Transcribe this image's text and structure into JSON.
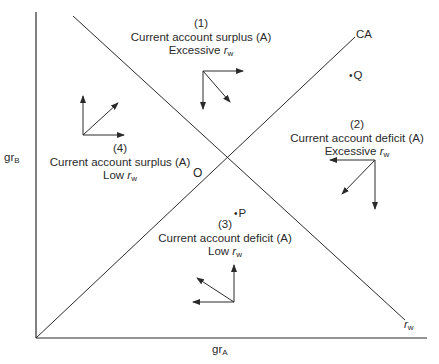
{
  "diagram": {
    "axes": {
      "x_label": "gr",
      "x_label_sub": "A",
      "y_label": "gr",
      "y_label_sub": "B"
    },
    "lines": {
      "ca": {
        "label": "CA"
      },
      "rw": {
        "label": "r",
        "label_sub": "w"
      }
    },
    "points": {
      "origin_intersection": "O",
      "p": "P",
      "q": "Q",
      "dot": "•"
    },
    "regions": [
      {
        "number": "(1)",
        "line1": "Current account surplus (A)",
        "line2_prefix": "Excessive ",
        "rw": "r",
        "rw_sub": "w"
      },
      {
        "number": "(2)",
        "line1": "Current account deficit (A)",
        "line2_prefix": "Excessive ",
        "rw": "r",
        "rw_sub": "w"
      },
      {
        "number": "(3)",
        "line1": "Current account deficit (A)",
        "line2_prefix": "Low ",
        "rw": "r",
        "rw_sub": "w"
      },
      {
        "number": "(4)",
        "line1": "Current account surplus (A)",
        "line2_prefix": "Low ",
        "rw": "r",
        "rw_sub": "w"
      }
    ],
    "colors": {
      "ink": "#2a2a2a",
      "background": "#ffffff"
    }
  }
}
